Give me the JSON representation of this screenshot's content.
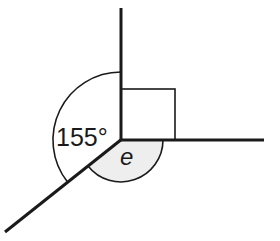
{
  "diagram": {
    "type": "angles-at-a-point",
    "labels": {
      "known_angle": "155°",
      "unknown_angle": "e"
    },
    "right_angle_marker": true,
    "colors": {
      "line": "#1a1a1a",
      "shade": "#eeeeee",
      "background": "#ffffff"
    }
  }
}
